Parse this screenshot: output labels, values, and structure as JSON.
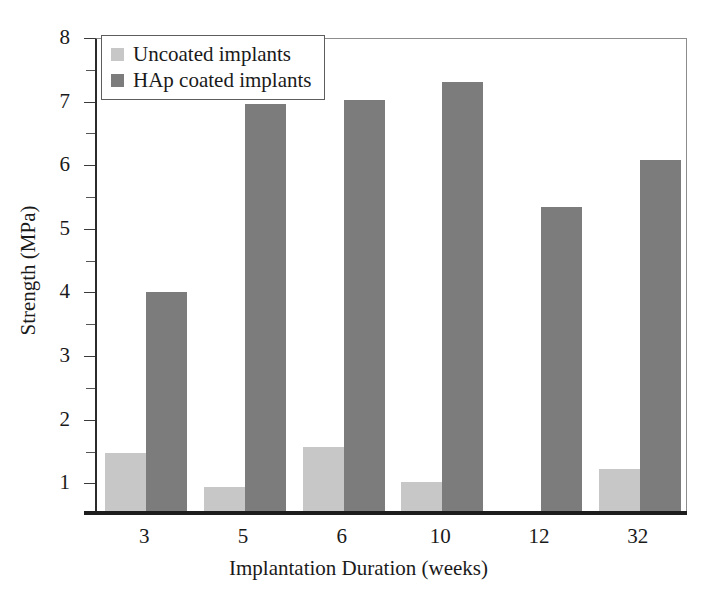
{
  "chart_data": {
    "type": "bar",
    "title": "",
    "xlabel": "Implantation Duration (weeks)",
    "ylabel": "Strength (MPa)",
    "categories": [
      "3",
      "5",
      "6",
      "10",
      "12",
      "32"
    ],
    "series": [
      {
        "name": "Uncoated implants",
        "color": "#c7c7c7",
        "values": [
          1.47,
          0.95,
          1.57,
          1.02,
          null,
          1.22
        ]
      },
      {
        "name": "HAp coated implants",
        "color": "#7c7c7c",
        "values": [
          4.01,
          6.96,
          7.02,
          7.31,
          5.35,
          6.09
        ]
      }
    ],
    "ylim": [
      0.55,
      8
    ],
    "yticks": [
      1,
      2,
      3,
      4,
      5,
      6,
      7,
      8
    ],
    "ytick_labels": [
      "1",
      "2",
      "3",
      "4",
      "5",
      "6",
      "7",
      "8"
    ],
    "yminor_ticks": [
      1.5,
      2.5,
      3.5,
      4.5,
      5.5,
      6.5,
      7.5
    ],
    "grid": false,
    "legend_position": "top-left"
  },
  "legend": {
    "entries": [
      {
        "label": "Uncoated implants",
        "swatch": "light"
      },
      {
        "label": "HAp coated implants",
        "swatch": "dark"
      }
    ]
  },
  "axes": {
    "y_title": "Strength (MPa)",
    "x_title": "Implantation Duration (weeks)"
  }
}
